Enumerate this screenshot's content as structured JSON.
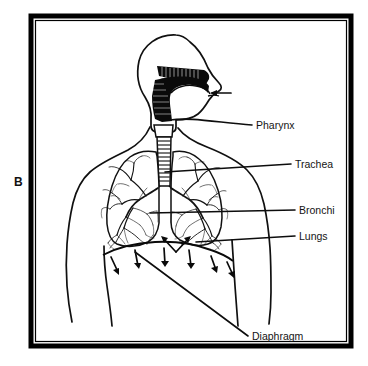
{
  "figure": {
    "panel_letter": "B",
    "frame_color": "#000000",
    "ink_color": "#0a0a0a",
    "background_color": "#ffffff"
  },
  "labels": [
    {
      "id": "pharynx",
      "text": "Pharynx",
      "x": 258,
      "y": 129
    },
    {
      "id": "trachea",
      "text": "Trachea",
      "x": 296,
      "y": 170
    },
    {
      "id": "bronchi",
      "text": "Bronchi",
      "x": 300,
      "y": 214
    },
    {
      "id": "lungs",
      "text": "Lungs",
      "x": 300,
      "y": 240
    },
    {
      "id": "diaphragm",
      "text": "Diaphragm",
      "x": 252,
      "y": 340
    }
  ],
  "anatomy_parts": [
    "head-profile",
    "nasal-cavity",
    "oral-cavity",
    "pharynx",
    "larynx",
    "trachea",
    "left-lung",
    "right-lung",
    "bronchial-tree",
    "diaphragm",
    "torso-outline"
  ],
  "airflow": {
    "nose_arrow_label": "inhaled-air-at-nostril",
    "diaphragm_arrow_count": 6,
    "diaphragm_arrow_direction": "downward"
  }
}
